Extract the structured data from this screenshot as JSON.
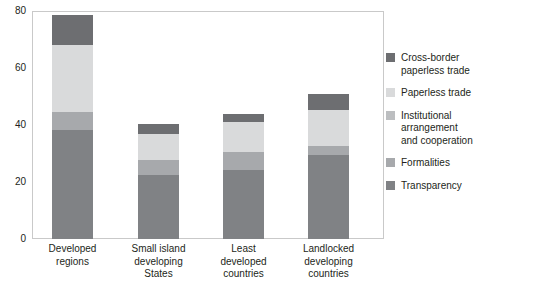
{
  "chart_data": {
    "type": "bar",
    "title": "",
    "subtitle": "",
    "xlabel": "",
    "ylabel": "",
    "stacked": true,
    "grid": false,
    "legend_position": "right",
    "ylim": [
      0,
      80
    ],
    "yticks": [
      "0",
      "20",
      "40",
      "60",
      "80"
    ],
    "ytick_values": [
      0,
      20,
      40,
      60,
      80
    ],
    "categories": [
      "Developed\nregions",
      "Small island\ndeveloping\nStates",
      "Least\ndeveloped\ncountries",
      "Landlocked\ndeveloping\ncountries"
    ],
    "category_labels": [
      {
        "line1": "Developed",
        "line2": "regions",
        "line3": ""
      },
      {
        "line1": "Small island",
        "line2": "developing",
        "line3": "States"
      },
      {
        "line1": "Least",
        "line2": "developed",
        "line3": "countries"
      },
      {
        "line1": "Landlocked",
        "line2": "developing",
        "line3": "countries"
      }
    ],
    "series": [
      {
        "name": "Transparency",
        "color": "#808285",
        "values": [
          38.2,
          22.5,
          24.2,
          29.5
        ]
      },
      {
        "name": "Formalities",
        "color": "#a7a9ac",
        "values": [
          6.4,
          5.2,
          6.3,
          3.1
        ]
      },
      {
        "name": "Institutional arrangement and cooperation",
        "color": "#bcbec0",
        "values": [
          0.0,
          0.0,
          0.0,
          0.0
        ]
      },
      {
        "name": "Paperless trade",
        "color": "#d9dadb",
        "values": [
          23.4,
          9.3,
          10.5,
          12.7
        ]
      },
      {
        "name": "Cross-border paperless trade",
        "color": "#6d6e71",
        "values": [
          10.5,
          3.5,
          3.0,
          5.7
        ]
      }
    ],
    "totals": [
      78.5,
      40.5,
      44.0,
      51.0
    ]
  },
  "legend": {
    "items": [
      {
        "label_line1": "Cross-border",
        "label_line2": "paperless trade",
        "label_line3": "",
        "color": "#6d6e71",
        "swatch_name": "cross-border-paperless-trade"
      },
      {
        "label_line1": "Paperless trade",
        "label_line2": "",
        "label_line3": "",
        "color": "#d9dadb",
        "swatch_name": "paperless-trade"
      },
      {
        "label_line1": "Institutional",
        "label_line2": "arrangement",
        "label_line3": "and cooperation",
        "color": "#bcbec0",
        "swatch_name": "institutional-arrangement-and-cooperation"
      },
      {
        "label_line1": "Formalities",
        "label_line2": "",
        "label_line3": "",
        "color": "#a7a9ac",
        "swatch_name": "formalities"
      },
      {
        "label_line1": "Transparency",
        "label_line2": "",
        "label_line3": "",
        "color": "#808285",
        "swatch_name": "transparency"
      }
    ]
  },
  "axis": {
    "y_ticks": [
      "80",
      "60",
      "40",
      "20",
      "0"
    ]
  }
}
